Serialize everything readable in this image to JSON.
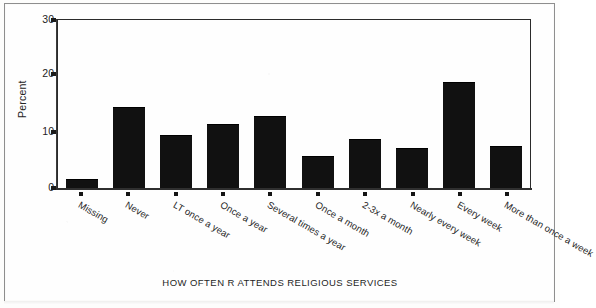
{
  "chart_data": {
    "type": "bar",
    "title": "",
    "subtitle": "",
    "xlabel": "HOW OFTEN R ATTENDS RELIGIOUS SERVICES",
    "ylabel": "Percent",
    "ylim": [
      0,
      30
    ],
    "yticks": [
      0,
      10,
      20,
      30
    ],
    "ytick_labels": [
      "0",
      "10",
      "20",
      "30"
    ],
    "grid": false,
    "legend": "none",
    "bar_color": "#111111",
    "categories": [
      "Missing",
      "Never",
      "LT once a year",
      "Once a year",
      "Several times a year",
      "Once a month",
      "2-3x a month",
      "Nearly every week",
      "Every week",
      "More than once a week"
    ],
    "values": [
      1.4,
      14.3,
      9.2,
      11.3,
      12.7,
      5.6,
      8.5,
      7.0,
      18.8,
      7.4
    ]
  },
  "axis": {
    "y_title": "Percent",
    "x_title": "HOW OFTEN R ATTENDS RELIGIOUS SERVICES"
  }
}
